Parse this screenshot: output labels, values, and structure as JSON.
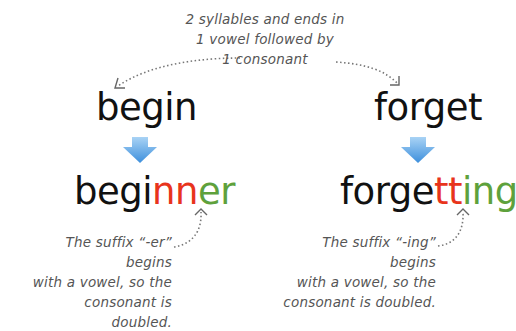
{
  "top_note": {
    "lines": [
      "2 syllables and ends in",
      "1 vowel followed by",
      "1 consonant"
    ]
  },
  "examples": [
    {
      "base_word": "begin",
      "result": {
        "stem": "begi",
        "doubled": "nn",
        "suffix": "er"
      },
      "note_lines": [
        "The suffix “-er” begins",
        "with a vowel, so the",
        "consonant is doubled."
      ]
    },
    {
      "base_word": "forget",
      "result": {
        "stem": "forge",
        "doubled": "tt",
        "suffix": "ing"
      },
      "note_lines": [
        "The suffix “-ing” begins",
        "with a vowel, so the",
        "consonant is doubled."
      ]
    }
  ],
  "colors": {
    "doubled_consonant": "#e8341c",
    "suffix": "#5ea13c",
    "arrow_top": "#a9d3f5",
    "arrow_bottom": "#3d8fdc",
    "note_text": "#555555"
  }
}
